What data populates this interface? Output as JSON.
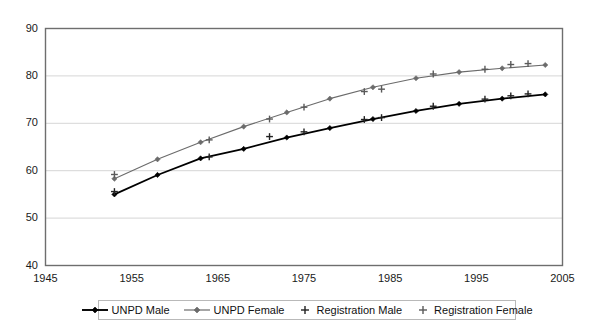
{
  "chart_data": {
    "type": "line",
    "title": "",
    "xlabel": "",
    "ylabel": "",
    "xlim": [
      1945,
      2005
    ],
    "ylim": [
      40,
      90
    ],
    "xticks": [
      1945,
      1955,
      1965,
      1975,
      1985,
      1995,
      2005
    ],
    "yticks": [
      40,
      50,
      60,
      70,
      80,
      90
    ],
    "grid": "horizontal",
    "legend_position": "bottom",
    "series": [
      {
        "name": "UNPD Male",
        "marker": "diamond",
        "color": "#000000",
        "line_width": 1.8,
        "x": [
          1953,
          1958,
          1963,
          1968,
          1973,
          1978,
          1983,
          1988,
          1993,
          1998,
          2003
        ],
        "values": [
          55.0,
          59.1,
          62.6,
          64.6,
          67.0,
          69.0,
          70.9,
          72.6,
          74.1,
          75.2,
          76.1
        ]
      },
      {
        "name": "UNPD Female",
        "marker": "diamond",
        "color": "#6b6b6b",
        "line_width": 1.1,
        "x": [
          1953,
          1958,
          1963,
          1968,
          1973,
          1978,
          1983,
          1988,
          1993,
          1998,
          2003
        ],
        "values": [
          58.3,
          62.4,
          66.0,
          69.3,
          72.3,
          75.2,
          77.6,
          79.5,
          80.8,
          81.6,
          82.3
        ]
      },
      {
        "name": "Registration Male",
        "marker": "plus",
        "color": "#222222",
        "line_width": 0,
        "x": [
          1953,
          1964,
          1971,
          1975,
          1982,
          1984,
          1990,
          1996,
          1999,
          2001
        ],
        "values": [
          55.6,
          62.9,
          67.2,
          68.2,
          70.8,
          71.2,
          73.6,
          75.1,
          75.8,
          76.2
        ]
      },
      {
        "name": "Registration Female",
        "marker": "plus",
        "color": "#5a5a5a",
        "line_width": 0,
        "x": [
          1953,
          1964,
          1971,
          1975,
          1982,
          1984,
          1990,
          1996,
          1999,
          2001
        ],
        "values": [
          59.2,
          66.5,
          70.9,
          73.4,
          76.7,
          77.2,
          80.4,
          81.4,
          82.4,
          82.6
        ]
      }
    ]
  },
  "legend": {
    "items": [
      {
        "label": "UNPD Male",
        "marker": "line-diamond",
        "color": "#000000"
      },
      {
        "label": "UNPD Female",
        "marker": "line-diamond",
        "color": "#6b6b6b"
      },
      {
        "label": "Registration Male",
        "marker": "plus",
        "color": "#222222"
      },
      {
        "label": "Registration Female",
        "marker": "plus",
        "color": "#5a5a5a"
      }
    ]
  },
  "axes": {
    "y_tick_labels": [
      "90",
      "80",
      "70",
      "60",
      "50",
      "40"
    ],
    "x_tick_labels": [
      "1945",
      "1955",
      "1965",
      "1975",
      "1985",
      "1995",
      "2005"
    ]
  }
}
